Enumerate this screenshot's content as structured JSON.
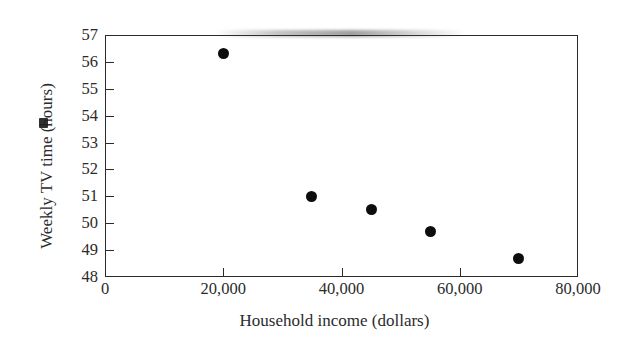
{
  "chart_data": {
    "type": "scatter",
    "title": "",
    "xlabel": "Household income (dollars)",
    "ylabel": "Weekly TV time (hours)",
    "xlim": [
      0,
      80000
    ],
    "ylim": [
      48,
      57
    ],
    "grid": false,
    "legend": null,
    "x": [
      20000,
      35000,
      45000,
      55000,
      70000
    ],
    "y": [
      56.3,
      51.0,
      50.5,
      49.7,
      48.7
    ],
    "points": [
      {
        "x": 20000,
        "y": 56.3
      },
      {
        "x": 35000,
        "y": 51.0
      },
      {
        "x": 45000,
        "y": 50.5
      },
      {
        "x": 55000,
        "y": 49.7
      },
      {
        "x": 70000,
        "y": 48.7
      }
    ],
    "xticks": [
      0,
      20000,
      40000,
      60000,
      80000
    ],
    "xtick_labels": [
      "0",
      "20,000",
      "40,000",
      "60,000",
      "80,000"
    ],
    "yticks": [
      48,
      49,
      50,
      51,
      52,
      53,
      54,
      55,
      56,
      57
    ],
    "ytick_labels": [
      "48",
      "49",
      "50",
      "51",
      "52",
      "53",
      "54",
      "55",
      "56",
      "57"
    ],
    "marker_color": "#0d0d0d",
    "axis_color": "#2a2a2a"
  },
  "axis_titles": {
    "x": "Household income (dollars)",
    "y_prefix": "Weekly TV time (",
    "y_smudged_letter": "h",
    "y_suffix": "ours)"
  }
}
